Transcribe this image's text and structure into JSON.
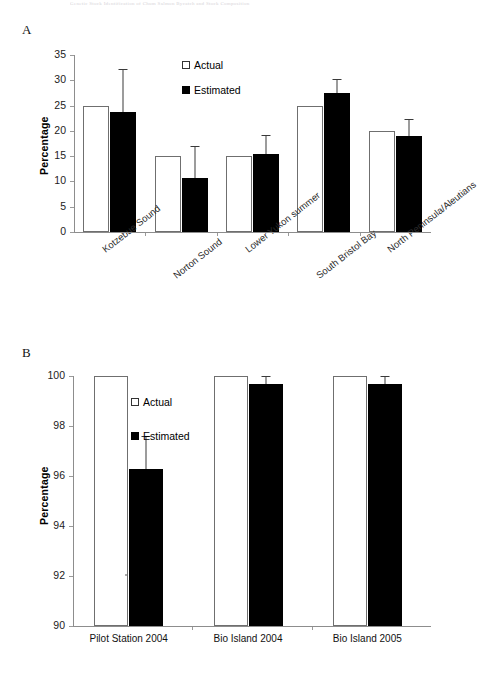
{
  "figure": {
    "header_faint": "Genetic Stock Identification of Chum Salmon Bycatch and Stock Composition",
    "panel_a_letter": "A",
    "panel_b_letter": "B"
  },
  "legend": {
    "actual": "Actual",
    "estimated": "Estimated"
  },
  "chart_data": [
    {
      "type": "bar",
      "panel": "A",
      "title": "",
      "xlabel": "",
      "ylabel": "Percentage",
      "ylim": [
        0,
        35
      ],
      "yticks": [
        0,
        5,
        10,
        15,
        20,
        25,
        30,
        35
      ],
      "ytick_labels": [
        "0",
        "5",
        "10",
        "15",
        "20",
        "25",
        "30",
        "35"
      ],
      "grid": false,
      "legend_position": "top-center",
      "categories": [
        "Kotzebue Sound",
        "Norton Sound",
        "Lower Yukon summer",
        "South Bristol Bay",
        "North Peninsula/Aleutians"
      ],
      "series": [
        {
          "name": "Actual",
          "values": [
            25.0,
            15.0,
            15.0,
            25.0,
            20.0
          ],
          "errors_upper": [
            null,
            null,
            null,
            null,
            null
          ]
        },
        {
          "name": "Estimated",
          "values": [
            23.8,
            10.7,
            15.5,
            27.5,
            18.9
          ],
          "errors_upper": [
            32.2,
            17.0,
            19.1,
            30.2,
            22.4
          ]
        }
      ]
    },
    {
      "type": "bar",
      "panel": "B",
      "title": "",
      "xlabel": "",
      "ylabel": "Percentage",
      "ylim": [
        90,
        100
      ],
      "yticks": [
        90,
        92,
        94,
        96,
        98,
        100
      ],
      "ytick_labels": [
        "90",
        "92",
        "94",
        "96",
        "98",
        "100"
      ],
      "grid": false,
      "legend_position": "upper-left-inside",
      "categories": [
        "Pilot Station 2004",
        "Bio Island 2004",
        "Bio Island 2005"
      ],
      "series": [
        {
          "name": "Actual",
          "values": [
            100.0,
            100.0,
            100.0
          ],
          "errors_upper": [
            null,
            null,
            null
          ]
        },
        {
          "name": "Estimated",
          "values": [
            96.3,
            99.7,
            99.7
          ],
          "errors_upper": [
            97.6,
            100.0,
            100.0
          ]
        }
      ]
    }
  ]
}
